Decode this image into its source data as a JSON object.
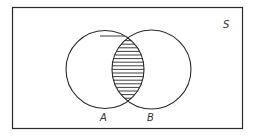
{
  "diagram": {
    "type": "venn",
    "universe_label": "S",
    "sets": [
      {
        "label": "A"
      },
      {
        "label": "B"
      }
    ],
    "shaded_region": "A ∩ B",
    "shading_style": "horizontal-hatch",
    "colors": {
      "stroke": "#2a2a2a",
      "background": "#ffffff"
    }
  }
}
